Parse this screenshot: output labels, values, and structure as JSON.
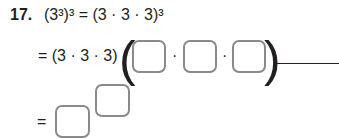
{
  "problem": {
    "number": "17.",
    "line1": "(3³)³ = (3 · 3 · 3)³",
    "line2_prefix": "= (3 · 3 · 3) ·",
    "line3_prefix": "=",
    "dot": "·"
  },
  "answer_boxes": [
    {
      "id": "factor-1",
      "value": ""
    },
    {
      "id": "factor-2",
      "value": ""
    },
    {
      "id": "factor-3",
      "value": ""
    },
    {
      "id": "base",
      "value": ""
    },
    {
      "id": "exponent",
      "value": ""
    }
  ]
}
